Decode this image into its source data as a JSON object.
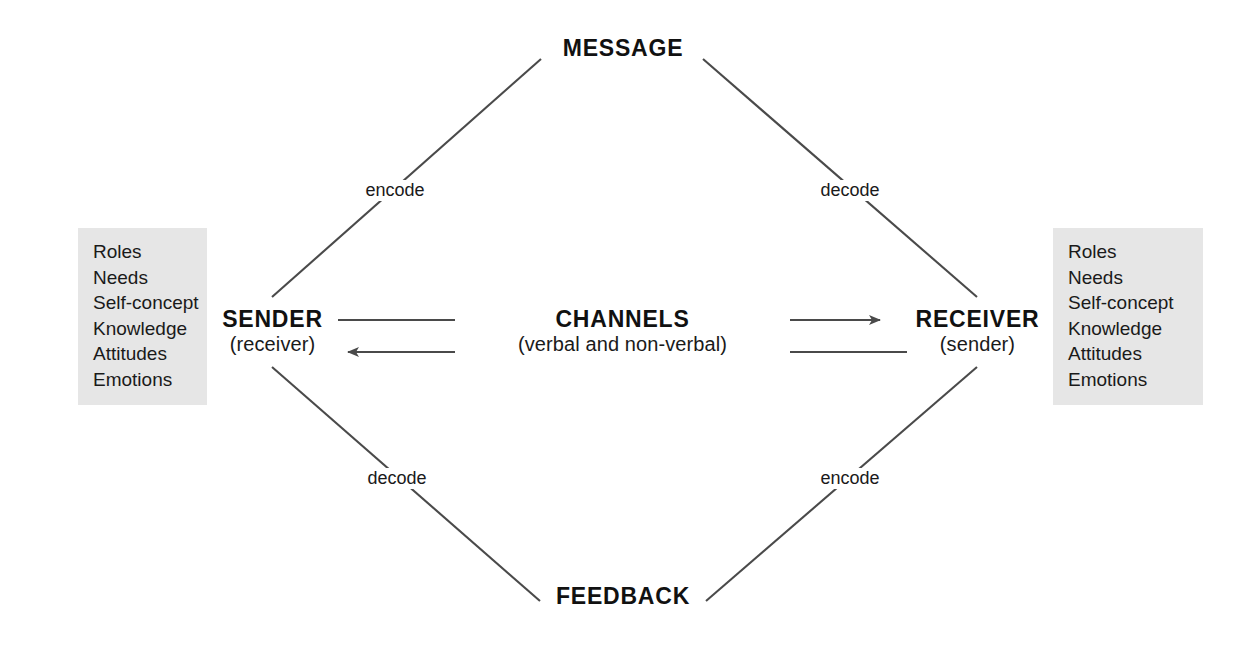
{
  "diagram": {
    "background_color": "#ffffff",
    "line_color": "#4a4a4a",
    "box_fill_color": "#e6e6e6",
    "text_color": "#1a1a1a",
    "nodes": {
      "message": {
        "label": "MESSAGE"
      },
      "feedback": {
        "label": "FEEDBACK"
      },
      "sender": {
        "label": "SENDER",
        "sublabel": "(receiver)"
      },
      "receiver": {
        "label": "RECEIVER",
        "sublabel": "(sender)"
      },
      "channels": {
        "label": "CHANNELS",
        "sublabel": "(verbal and non-verbal)"
      }
    },
    "edge_labels": {
      "top_left": "encode",
      "top_right": "decode",
      "bottom_left": "decode",
      "bottom_right": "encode"
    },
    "attributes_left": {
      "items": [
        "Roles",
        "Needs",
        "Self-concept",
        "Knowledge",
        "Attitudes",
        "Emotions"
      ]
    },
    "attributes_right": {
      "items": [
        "Roles",
        "Needs",
        "Self-concept",
        "Knowledge",
        "Attitudes",
        "Emotions"
      ]
    }
  }
}
